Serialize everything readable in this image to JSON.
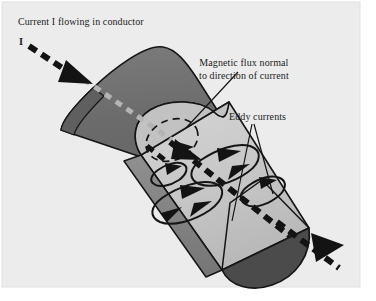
{
  "figure": {
    "kind": "technical-illustration",
    "background_color": "#ececec",
    "page_color": "#ffffff",
    "colors": {
      "conductor_dark": "#6d6d6d",
      "conductor_mid": "#8d8d8d",
      "conductor_light": "#c9c9c9",
      "conductor_end_dark": "#4a4a4a",
      "outline": "#151515",
      "current_arrow": "#131313",
      "hidden_current": "#b3b3b3",
      "text": "#1c1c1c"
    }
  },
  "labels": {
    "current": "Current I flowing in conductor",
    "current_symbol": "I",
    "flux_line1": "Magnetic flux normal",
    "flux_line2": "to direction of current",
    "eddy": "Eddy currents"
  },
  "elements": {
    "conductor": "half-cut cylindrical conductor",
    "current_arrow_in": "thick black dashed arrow entering conductor at upper left",
    "current_arrow_through": "thick black dashed arrow along conductor axis",
    "current_arrow_out": "thick black dashed arrow exiting conductor at lower right",
    "hidden_current_segment": "grey dashed line showing current hidden inside conductor",
    "flux_loop": "dashed circular loop around current axis at cut face",
    "eddy_loops": "four elongated closed loops with solid arrowheads in conductor interior",
    "leader_flux": "line from flux label to cut face",
    "leader_eddy_left": "line from eddy label to lower eddy loop",
    "leader_eddy_right": "line from eddy label to right eddy loop"
  }
}
